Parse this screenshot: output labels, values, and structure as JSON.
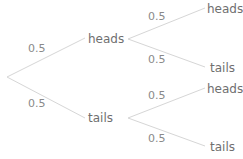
{
  "tree": {
    "root_branches": [
      {
        "probability": "0.5",
        "outcome": "heads"
      },
      {
        "probability": "0.5",
        "outcome": "tails"
      }
    ],
    "heads_branches": [
      {
        "probability": "0.5",
        "outcome": "heads"
      },
      {
        "probability": "0.5",
        "outcome": "tails"
      }
    ],
    "tails_branches": [
      {
        "probability": "0.5",
        "outcome": "heads"
      },
      {
        "probability": "0.5",
        "outcome": "tails"
      }
    ]
  },
  "colors": {
    "line": "#d6d6d6",
    "text": "#6f6f6f"
  }
}
